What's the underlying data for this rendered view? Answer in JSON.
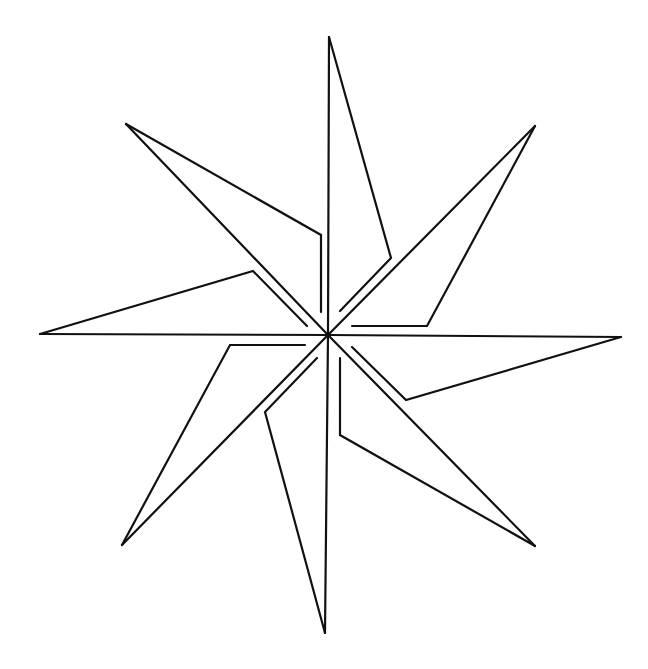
{
  "diagram": {
    "title": "",
    "stroke_color": "#111111",
    "background_color": "#ffffff",
    "stroke_width": 2.2,
    "center": [
      328,
      335
    ],
    "blades": [
      {
        "name": "north",
        "tip": [
          329,
          37
        ],
        "elbow": [
          391,
          258
        ],
        "inner_end": [
          340,
          311
        ]
      },
      {
        "name": "northeast",
        "tip": [
          535,
          126
        ],
        "elbow": [
          427,
          326
        ],
        "inner_end": [
          352,
          326
        ]
      },
      {
        "name": "east",
        "tip": [
          621,
          337
        ],
        "elbow": [
          406,
          400
        ],
        "inner_end": [
          352,
          347
        ]
      },
      {
        "name": "southeast",
        "tip": [
          535,
          546
        ],
        "elbow": [
          340,
          435
        ],
        "inner_end": [
          340,
          358
        ]
      },
      {
        "name": "south",
        "tip": [
          325,
          633
        ],
        "elbow": [
          265,
          412
        ],
        "inner_end": [
          317,
          358
        ]
      },
      {
        "name": "southwest",
        "tip": [
          122,
          545
        ],
        "elbow": [
          230,
          345
        ],
        "inner_end": [
          305,
          345
        ]
      },
      {
        "name": "west",
        "tip": [
          40,
          334
        ],
        "elbow": [
          253,
          271
        ],
        "inner_end": [
          307,
          326
        ]
      },
      {
        "name": "northwest",
        "tip": [
          126,
          124
        ],
        "elbow": [
          321,
          235
        ],
        "inner_end": [
          321,
          312
        ]
      }
    ]
  }
}
